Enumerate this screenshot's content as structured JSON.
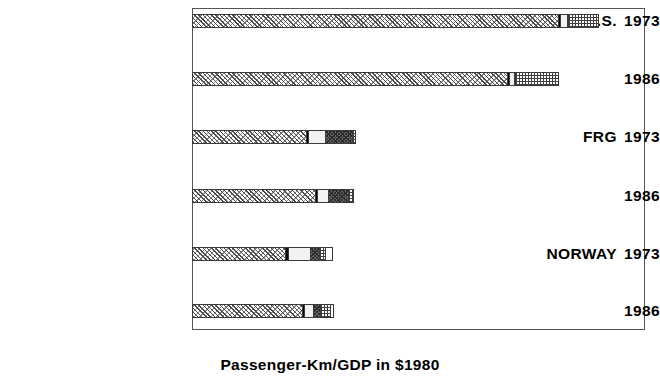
{
  "chart_data": {
    "type": "bar",
    "orientation": "horizontal",
    "stacked": true,
    "title": "",
    "xlabel": "Passenger-Km/GDP in $1980",
    "ylabel": "",
    "xlim": [
      0,
      2
    ],
    "xticks": [
      0,
      0.5,
      1,
      1.5,
      2
    ],
    "xtick_labels": [
      "0",
      "0.5",
      "1",
      "1.5",
      "2"
    ],
    "grid": false,
    "legend_position": "right-middle",
    "series_order": [
      "Auto",
      "M'Cycle",
      "Bus",
      "Rail",
      "Air",
      "Sea"
    ],
    "legend": [
      {
        "label": "Sea",
        "pattern": "solid-white"
      },
      {
        "label": "Air",
        "pattern": "fine-grid"
      },
      {
        "label": "Rail",
        "pattern": "dark-checker"
      },
      {
        "label": "Bus",
        "pattern": "light-solid"
      },
      {
        "label": "M'Cycle",
        "pattern": "solid-black"
      },
      {
        "label": "Auto",
        "pattern": "diagonal-hatch"
      }
    ],
    "groups": [
      {
        "country": "U.S.",
        "rows": [
          {
            "year": "1973",
            "segments": {
              "Auto": 1.615,
              "M'Cycle": 0.01,
              "Bus": 0.032,
              "Rail": 0.004,
              "Air": 0.125,
              "Sea": 0.0
            },
            "total": 1.786
          },
          {
            "year": "1986",
            "segments": {
              "Auto": 1.39,
              "M'Cycle": 0.008,
              "Bus": 0.022,
              "Rail": 0.004,
              "Air": 0.186,
              "Sea": 0.0
            },
            "total": 1.61
          }
        ]
      },
      {
        "country": "FRG",
        "rows": [
          {
            "year": "1973",
            "segments": {
              "Auto": 0.505,
              "M'Cycle": 0.008,
              "Bus": 0.075,
              "Rail": 0.118,
              "Air": 0.01,
              "Sea": 0.0
            },
            "total": 0.716
          },
          {
            "year": "1986",
            "segments": {
              "Auto": 0.543,
              "M'Cycle": 0.01,
              "Bus": 0.049,
              "Rail": 0.086,
              "Air": 0.018,
              "Sea": 0.0
            },
            "total": 0.706
          }
        ]
      },
      {
        "country": "NORWAY",
        "rows": [
          {
            "year": "1973",
            "segments": {
              "Auto": 0.41,
              "M'Cycle": 0.016,
              "Bus": 0.093,
              "Rail": 0.043,
              "Air": 0.024,
              "Sea": 0.029
            },
            "total": 0.615
          },
          {
            "year": "1986",
            "segments": {
              "Auto": 0.484,
              "M'Cycle": 0.01,
              "Bus": 0.042,
              "Rail": 0.031,
              "Air": 0.041,
              "Sea": 0.012
            },
            "total": 0.62
          }
        ]
      },
      {
        "country": "SWEDEN",
        "rows": [
          {
            "year": "1973",
            "segments": {
              "Auto": 0.555,
              "M'Cycle": 0.006,
              "Bus": 0.046,
              "Rail": 0.062,
              "Air": 0.014,
              "Sea": 0.0
            },
            "total": 0.683
          },
          {
            "year": "1986",
            "segments": {
              "Auto": 0.552,
              "M'Cycle": 0.006,
              "Bus": 0.048,
              "Rail": 0.055,
              "Air": 0.039,
              "Sea": 0.0
            },
            "total": 0.7
          }
        ]
      },
      {
        "country": "U.K.",
        "rows": [
          {
            "year": "1973",
            "segments": {
              "Auto": 0.674,
              "M'Cycle": 0.014,
              "Bus": 0.138,
              "Rail": 0.087,
              "Air": 0.012,
              "Sea": 0.0
            },
            "total": 0.925
          },
          {
            "year": "1986",
            "segments": {
              "Auto": 0.806,
              "M'Cycle": 0.01,
              "Bus": 0.072,
              "Rail": 0.077,
              "Air": 0.014,
              "Sea": 0.0
            },
            "total": 0.979
          }
        ]
      },
      {
        "country": "JAPAN",
        "rows": [
          {
            "year": "1973",
            "segments": {
              "Auto": 0.272,
              "M'Cycle": 0.006,
              "Bus": 0.104,
              "Rail": 0.412,
              "Air": 0.022,
              "Sea": 0.007
            },
            "total": 0.823
          },
          {
            "year": "1986",
            "segments": {
              "Auto": 0.272,
              "M'Cycle": 0.006,
              "Bus": 0.084,
              "Rail": 0.282,
              "Air": 0.024,
              "Sea": 0.008
            },
            "total": 0.676
          }
        ]
      }
    ]
  }
}
